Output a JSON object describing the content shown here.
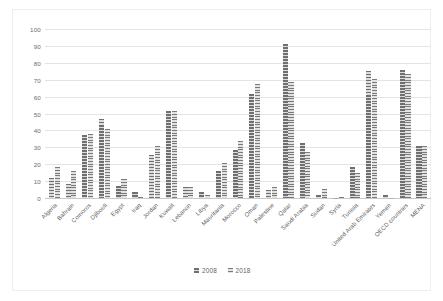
{
  "chart_data": {
    "type": "bar",
    "title": "",
    "subtitle": "",
    "xlabel": "",
    "ylabel": "",
    "ylim": [
      0,
      100
    ],
    "yticks": [
      100,
      90,
      80,
      70,
      60,
      50,
      40,
      30,
      20,
      10,
      0
    ],
    "grid": true,
    "legend_position": "bottom",
    "categories": [
      "Algeria",
      "Bahrain",
      "Comoros",
      "Djibouti",
      "Egypt",
      "Iraq",
      "Jordan",
      "Kuwait",
      "Lebanon",
      "Libya",
      "Mauritania",
      "Morocco",
      "Oman",
      "Palestine",
      "Qatar",
      "Saudi Arabia",
      "Sudan",
      "Syria",
      "Tunisia",
      "United Arab Emirates",
      "Yemen",
      "OECD countries",
      "MENA"
    ],
    "series": [
      {
        "name": "2008",
        "color": "#9a9a9a",
        "values": [
          12,
          8.5,
          37,
          46.5,
          7,
          3.5,
          25.5,
          51.5,
          6.5,
          3.5,
          16,
          28.5,
          61.5,
          4.5,
          91,
          32.5,
          1.5,
          0,
          18.5,
          75,
          1.5,
          75.5,
          30.5
        ]
      },
      {
        "name": "2018",
        "color": "#b0b0b0",
        "values": [
          18.5,
          16,
          38,
          41,
          11.5,
          0.5,
          30.5,
          51.5,
          6.5,
          1.5,
          21,
          33.5,
          67.5,
          6.5,
          68.5,
          27.5,
          5.5,
          0.5,
          15,
          70.5,
          0.3,
          73.5,
          31
        ]
      }
    ]
  },
  "legend": {
    "items": [
      {
        "label": "2008"
      },
      {
        "label": "2018"
      }
    ]
  }
}
